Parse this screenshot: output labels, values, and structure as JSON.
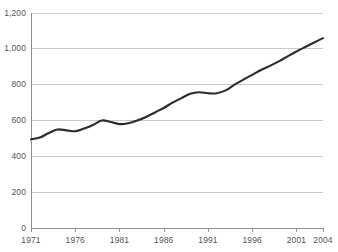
{
  "chart_data": {
    "type": "line",
    "title": "",
    "xlabel": "",
    "ylabel": "",
    "xlim": [
      1971,
      2004
    ],
    "ylim": [
      0,
      1200
    ],
    "grid": true,
    "legend": "none",
    "line_color": "#2b2b2b",
    "grid_color": "#c9c9c9",
    "axis_color": "#8f8f8f",
    "label_color": "#555555",
    "background": "#ffffff",
    "ytick_labels": [
      "0",
      "200",
      "400",
      "600",
      "800",
      "1,000",
      "1,200"
    ],
    "ytick_values": [
      0,
      200,
      400,
      600,
      800,
      1000,
      1200
    ],
    "xtick_labels": [
      "1971",
      "1976",
      "1981",
      "1986",
      "1991",
      "1996",
      "2001",
      "2004"
    ],
    "xtick_values": [
      1971,
      1976,
      1981,
      1986,
      1991,
      1996,
      2001,
      2004
    ],
    "x": [
      1971,
      1972,
      1973,
      1974,
      1975,
      1976,
      1977,
      1978,
      1979,
      1980,
      1981,
      1982,
      1983,
      1984,
      1985,
      1986,
      1987,
      1988,
      1989,
      1990,
      1991,
      1992,
      1993,
      1994,
      1995,
      1996,
      1997,
      1998,
      1999,
      2000,
      2001,
      2002,
      2003,
      2004
    ],
    "values": [
      495,
      505,
      530,
      550,
      545,
      540,
      555,
      575,
      600,
      592,
      580,
      585,
      600,
      620,
      645,
      670,
      700,
      725,
      750,
      758,
      752,
      752,
      768,
      800,
      828,
      855,
      882,
      905,
      930,
      958,
      985,
      1010,
      1035,
      1060
    ],
    "series": [
      {
        "name": "series-1",
        "values": [
          495,
          505,
          530,
          550,
          545,
          540,
          555,
          575,
          600,
          592,
          580,
          585,
          600,
          620,
          645,
          670,
          700,
          725,
          750,
          758,
          752,
          752,
          768,
          800,
          828,
          855,
          882,
          905,
          930,
          958,
          985,
          1010,
          1035,
          1060
        ]
      }
    ]
  }
}
